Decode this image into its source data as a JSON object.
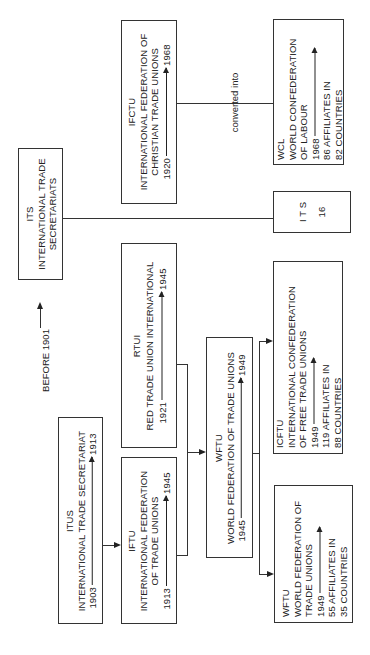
{
  "diagram": {
    "orientation": "rotated-90-ccw",
    "before_label": "BEFORE 1901",
    "connector_label": "converted into",
    "nodes": {
      "its_main": {
        "abbr": "ITS",
        "name_line1": "INTERNATIONAL TRADE",
        "name_line2": "SECRETARIATS"
      },
      "ifctu": {
        "abbr": "IFCTU",
        "name_line1": "INTERNATIONAL FEDERATION OF",
        "name_line2": "CHRISTIAN TRADE UNIONS",
        "start": "1920",
        "end": "1968"
      },
      "wcl": {
        "abbr": "WCL",
        "name_line1": "WORLD CONFEDERATION",
        "name_line2": "OF LABOUR",
        "start": "1968",
        "affiliates": "86 AFFILIATES IN",
        "countries": "82 COUNTRIES"
      },
      "its_count": {
        "abbr": "I T S",
        "count": "16"
      },
      "rtui": {
        "abbr": "RTUI",
        "name_line1": "RED TRADE UNION INTERNATIONAL",
        "start": "1921",
        "end": "1945"
      },
      "itus": {
        "abbr": "ITUS",
        "name_line1": "INTERNATIONAL TRADE SECRETARIAT",
        "start": "1903",
        "end": "1913"
      },
      "iftu": {
        "abbr": "IFTU",
        "name_line1": "INTERNATIONAL FEDERATION",
        "name_line2": "OF TRADE UNIONS",
        "start": "1913",
        "end": "1945"
      },
      "wftu_1945": {
        "abbr": "WFTU",
        "name_line1": "WORLD FEDERATION OF TRADE UNIONS",
        "start": "1945",
        "end": "1949"
      },
      "icftu": {
        "abbr": "ICFTU",
        "name_line1": "INTERNATIONAL CONFEDERATION",
        "name_line2": "OF FREE TRADE UNIONS",
        "start": "1949",
        "affiliates": "119 AFFILIATES IN",
        "countries": "88 COUNTRIES"
      },
      "wftu_1949": {
        "abbr": "WFTU",
        "name_line1": "WORLD FEDERATION OF",
        "name_line2": "TRADE UNIONS",
        "start": "1949",
        "affiliates": "55 AFFILIATES IN",
        "countries": "35 COUNTRIES"
      }
    },
    "edges": [
      {
        "from": "its_main",
        "to": "its_count"
      },
      {
        "from": "ifctu",
        "to": "wcl",
        "label": "converted into"
      },
      {
        "from": "itus",
        "to": "iftu"
      },
      {
        "from": "iftu",
        "to": "wftu_1945"
      },
      {
        "from": "rtui",
        "to": "wftu_1945"
      },
      {
        "from": "wftu_1945",
        "to": "icftu"
      },
      {
        "from": "wftu_1945",
        "to": "wftu_1949"
      }
    ],
    "colors": {
      "line": "#333333",
      "background": "#ffffff",
      "text": "#222222"
    }
  }
}
